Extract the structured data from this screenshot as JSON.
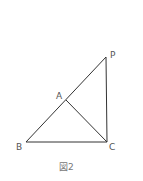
{
  "figure": {
    "caption": "図2",
    "stroke_color": "#333333",
    "points": {
      "P": {
        "label": "P",
        "x": 106,
        "y": 57
      },
      "A": {
        "label": "A",
        "x": 66,
        "y": 100
      },
      "B": {
        "label": "B",
        "x": 26,
        "y": 142
      },
      "C": {
        "label": "C",
        "x": 107,
        "y": 142
      }
    },
    "segments": [
      "BP",
      "BC",
      "PC",
      "AC"
    ]
  }
}
